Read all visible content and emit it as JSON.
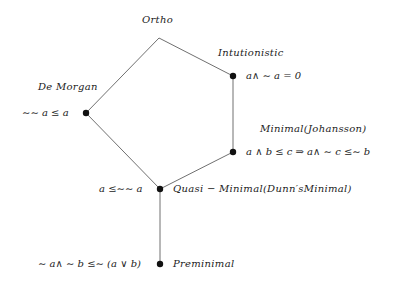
{
  "diagram": {
    "type": "lattice",
    "nodes": [
      {
        "id": "ortho",
        "name": "Ortho",
        "formula": "",
        "x": 159,
        "y": 38
      },
      {
        "id": "intuitionistic",
        "name": "Intutionistic",
        "formula": "a∧ ∼ a = 0",
        "x": 233,
        "y": 76
      },
      {
        "id": "demorgan",
        "name": "De Morgan",
        "formula": "∼∼ a ≤ a",
        "x": 86,
        "y": 113
      },
      {
        "id": "minimal",
        "name": "Minimal(Johansson)",
        "formula": "a ∧ b ≤ c ⇒ a∧ ∼ c ≤∼ b",
        "x": 233,
        "y": 152
      },
      {
        "id": "quasi",
        "name": "Quasi − Minimal(Dunn′sMinimal)",
        "formula": "a ≤∼∼ a",
        "x": 160,
        "y": 189
      },
      {
        "id": "preminimal",
        "name": "Preminimal",
        "formula": "∼ a∧ ∼ b ≤∼ (a ∨ b)",
        "x": 160,
        "y": 264
      }
    ],
    "edges": [
      [
        "ortho",
        "intuitionistic"
      ],
      [
        "ortho",
        "demorgan"
      ],
      [
        "intuitionistic",
        "minimal"
      ],
      [
        "demorgan",
        "quasi"
      ],
      [
        "minimal",
        "quasi"
      ],
      [
        "quasi",
        "preminimal"
      ]
    ],
    "edge_color": "#707070",
    "node_color": "#111111"
  },
  "labels": {
    "ortho": "Ortho",
    "intuitionistic": "Intutionistic",
    "intuitionistic_formula": "a∧ ∼ a = 0",
    "demorgan": "De Morgan",
    "demorgan_formula": "∼∼ a ≤ a",
    "minimal": "Minimal(Johansson)",
    "minimal_formula": "a ∧ b ≤ c ⇒ a∧ ∼ c ≤∼ b",
    "quasi": "Quasi − Minimal(Dunn′sMinimal)",
    "quasi_formula": "a ≤∼∼ a",
    "preminimal": "Preminimal",
    "preminimal_formula": "∼ a∧ ∼ b ≤∼ (a ∨ b)"
  }
}
